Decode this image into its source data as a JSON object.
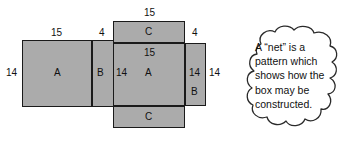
{
  "diagram": {
    "fill_color": "#ababab",
    "stroke_color": "#1a1a1a",
    "faces": [
      {
        "id": "face-a-left",
        "label": "A"
      },
      {
        "id": "face-b-left",
        "label": "B"
      },
      {
        "id": "face-c-top",
        "label": "C"
      },
      {
        "id": "face-a-center",
        "label": "A"
      },
      {
        "id": "face-c-bottom",
        "label": "C"
      },
      {
        "id": "face-b-right",
        "label": "B"
      }
    ],
    "dimensions": {
      "left_a_top": "15",
      "left_a_side": "14",
      "left_b_top": "4",
      "left_b_label": "B",
      "top_c_width": "15",
      "center_a_top": "15",
      "center_a_left": "14",
      "center_a_right": "14",
      "right_b_top": "4",
      "right_b_side": "14"
    }
  },
  "callout": {
    "name": "net-definition-callout",
    "line1": "A “net” is a",
    "line2": "pattern which",
    "line3": "shows how the",
    "line4": "box may be",
    "line5": "constructed."
  }
}
